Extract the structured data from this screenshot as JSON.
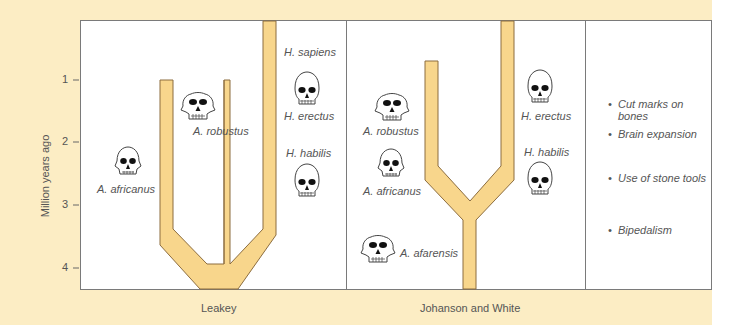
{
  "axis": {
    "label": "Million years ago",
    "ticks": [
      "1",
      "2",
      "3",
      "4"
    ]
  },
  "panels": {
    "leakey": {
      "title": "Leakey",
      "species": {
        "a_africanus": "A. africanus",
        "a_robustus": "A. robustus",
        "h_sapiens": "H. sapiens",
        "h_erectus": "H. erectus",
        "h_habilis": "H. habilis"
      }
    },
    "johanson_white": {
      "title": "Johanson and White",
      "species": {
        "a_robustus": "A. robustus",
        "a_africanus": "A. africanus",
        "a_afarensis": "A. afarensis",
        "h_erectus": "H. erectus",
        "h_habilis": "H. habilis"
      }
    },
    "traits": {
      "items": [
        {
          "bullet": "•",
          "lines": [
            "Cut marks on",
            "bones"
          ]
        },
        {
          "bullet": "•",
          "lines": [
            "Brain expansion"
          ]
        },
        {
          "bullet": "•",
          "lines": [
            "Use of stone tools"
          ]
        },
        {
          "bullet": "•",
          "lines": [
            "Bipedalism"
          ]
        }
      ]
    }
  },
  "colors": {
    "background": "#fcedc4",
    "branch_fill": "#f8d68c",
    "branch_stroke": "#8c6d3f",
    "frame": "#7a7a7a",
    "text": "#555555"
  }
}
